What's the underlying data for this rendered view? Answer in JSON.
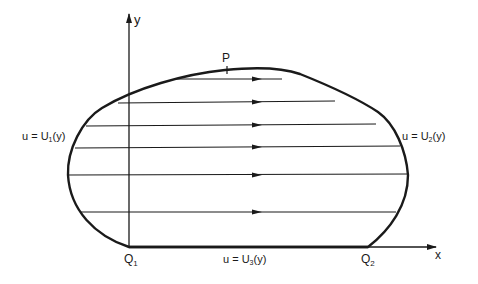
{
  "diagram": {
    "axes": {
      "x_label": "x",
      "y_label": "y"
    },
    "points": {
      "p_label": "P",
      "q1_label": "Q",
      "q1_sub": "1",
      "q2_label": "Q",
      "q2_sub": "2"
    },
    "boundary_labels": {
      "left": {
        "prefix": "u = U",
        "sub": "1",
        "suffix": "(y)"
      },
      "right": {
        "prefix": "u = U",
        "sub": "2",
        "suffix": "(y)"
      },
      "bottom": {
        "prefix": "u = U",
        "sub": "3",
        "suffix": "(y)"
      }
    },
    "flow_lines": [
      {
        "y": 79
      },
      {
        "y": 102
      },
      {
        "y": 125
      },
      {
        "y": 147
      },
      {
        "y": 175
      },
      {
        "y": 212
      }
    ],
    "colors": {
      "stroke": "#1a1a1a",
      "background": "#ffffff"
    }
  }
}
